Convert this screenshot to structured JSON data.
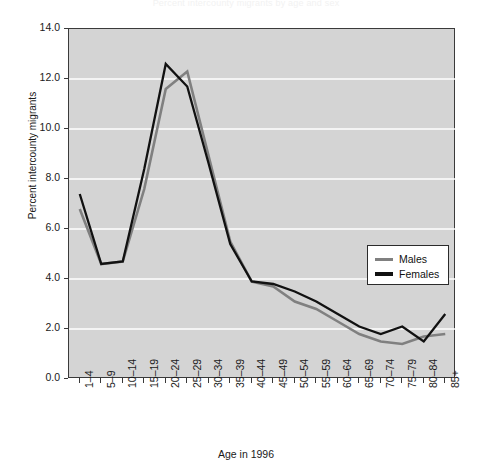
{
  "chart_data": {
    "type": "line",
    "title": "Percent intercounty migrants by age and sex",
    "xlabel": "Age in 1996",
    "ylabel": "Percent intercounty migrants",
    "categories": [
      "1–4",
      "5–9",
      "10–14",
      "15–19",
      "20–24",
      "25–29",
      "30–34",
      "35–39",
      "40–44",
      "45–49",
      "50–54",
      "55–59",
      "60–64",
      "65–69",
      "70–74",
      "75–79",
      "80–84",
      "85+"
    ],
    "series": [
      {
        "name": "Males",
        "color": "#808080",
        "values": [
          6.8,
          4.6,
          4.7,
          7.6,
          11.6,
          12.3,
          8.9,
          5.5,
          3.9,
          3.7,
          3.1,
          2.8,
          2.3,
          1.8,
          1.5,
          1.4,
          1.7,
          1.8
        ]
      },
      {
        "name": "Females",
        "color": "#111111",
        "values": [
          7.4,
          4.6,
          4.7,
          8.4,
          12.6,
          11.7,
          8.6,
          5.4,
          3.9,
          3.8,
          3.5,
          3.1,
          2.6,
          2.1,
          1.8,
          2.1,
          1.5,
          2.6
        ]
      }
    ],
    "ylim": [
      0.0,
      14.0
    ],
    "yticks": [
      "0.0",
      "2.0",
      "4.0",
      "6.0",
      "8.0",
      "10.0",
      "12.0",
      "14.0"
    ],
    "ytick_values": [
      0,
      2,
      4,
      6,
      8,
      10,
      12,
      14
    ],
    "grid": "horizontal",
    "grid_color": "#ffffff",
    "plot_background": "#d4d4d4",
    "legend_position": "center-right"
  },
  "legend": {
    "items": [
      {
        "label": "Males",
        "color": "#808080"
      },
      {
        "label": "Females",
        "color": "#111111"
      }
    ]
  }
}
